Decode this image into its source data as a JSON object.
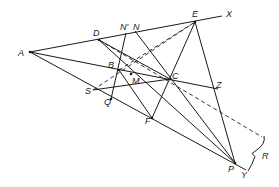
{
  "diagram": {
    "points": {
      "A": {
        "x": 30,
        "y": 52,
        "label": "A",
        "lx": 18,
        "ly": 56
      },
      "D": {
        "x": 99,
        "y": 40,
        "label": "D",
        "lx": 93,
        "ly": 36
      },
      "E": {
        "x": 195,
        "y": 22,
        "label": "E",
        "lx": 192,
        "ly": 17
      },
      "X": {
        "x": 222,
        "y": 16,
        "label": "X",
        "lx": 226,
        "ly": 17
      },
      "Np": {
        "x": 126,
        "y": 33,
        "label": "N'",
        "lx": 120,
        "ly": 30
      },
      "N": {
        "x": 135,
        "y": 31,
        "label": "N",
        "lx": 133,
        "ly": 30
      },
      "B": {
        "x": 119,
        "y": 70,
        "label": "B",
        "lx": 108,
        "ly": 68
      },
      "M": {
        "x": 131,
        "y": 74,
        "label": "M",
        "lx": 132,
        "ly": 84
      },
      "C": {
        "x": 170,
        "y": 79,
        "label": "C",
        "lx": 172,
        "ly": 79
      },
      "Z": {
        "x": 218,
        "y": 89,
        "label": "Z",
        "lx": 216,
        "ly": 88
      },
      "S": {
        "x": 93,
        "y": 90,
        "label": "S",
        "lx": 85,
        "ly": 94
      },
      "Q": {
        "x": 111,
        "y": 99,
        "label": "Q",
        "lx": 104,
        "ly": 105
      },
      "F": {
        "x": 152,
        "y": 118,
        "label": "F",
        "lx": 145,
        "ly": 124
      },
      "P": {
        "x": 235,
        "y": 163,
        "label": "P",
        "lx": 228,
        "ly": 172
      },
      "Y": {
        "x": 246,
        "y": 170,
        "label": "Y",
        "lx": 241,
        "ly": 178
      },
      "R": {
        "label": "R",
        "lx": 262,
        "ly": 159
      }
    },
    "solid_lines": [
      [
        "A",
        "X"
      ],
      [
        "A",
        "Z"
      ],
      [
        "A",
        "Y"
      ],
      [
        "D",
        "P"
      ],
      [
        "E",
        "P"
      ],
      [
        "E",
        "F"
      ],
      [
        "N",
        "P"
      ],
      [
        "Np",
        "Q"
      ],
      [
        "D",
        "C"
      ],
      [
        "S",
        "C"
      ],
      [
        "B",
        "F"
      ]
    ],
    "dashed_lines": [
      [
        "B",
        "E"
      ],
      [
        "D",
        "R_end"
      ],
      [
        "S",
        "E"
      ]
    ],
    "R_end": {
      "x": 262,
      "y": 137
    },
    "brace_R": {
      "from": {
        "x": 264,
        "y": 136
      },
      "to": {
        "x": 248,
        "y": 171
      }
    }
  }
}
